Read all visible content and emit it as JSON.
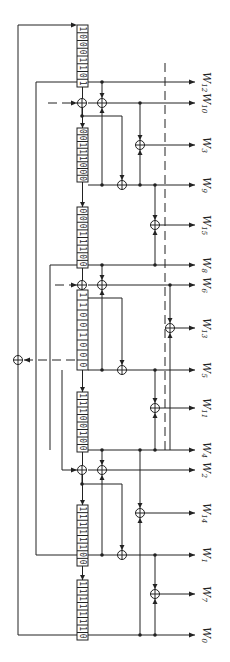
{
  "diagram": {
    "title": "",
    "orientation": "rotated-90",
    "registers": [
      {
        "id": "reg1",
        "bits": "10001101"
      },
      {
        "id": "reg2",
        "bits": "00111000"
      },
      {
        "id": "reg3",
        "bits": "00011100"
      },
      {
        "id": "reg4",
        "bits": "11001000"
      },
      {
        "id": "reg5",
        "bits": "11100100"
      },
      {
        "id": "reg6",
        "bits": "11111100"
      },
      {
        "id": "reg7",
        "bits": "11111110"
      }
    ],
    "outputs": [
      {
        "id": "W12",
        "base": "W",
        "sub": "12"
      },
      {
        "id": "W10",
        "base": "W",
        "sub": "10"
      },
      {
        "id": "W3",
        "base": "W",
        "sub": "3"
      },
      {
        "id": "W9",
        "base": "W",
        "sub": "9"
      },
      {
        "id": "W15",
        "base": "W",
        "sub": "15"
      },
      {
        "id": "W8",
        "base": "W",
        "sub": "8"
      },
      {
        "id": "W6",
        "base": "W",
        "sub": "6"
      },
      {
        "id": "W13",
        "base": "W",
        "sub": "13"
      },
      {
        "id": "W5",
        "base": "W",
        "sub": "5"
      },
      {
        "id": "W11",
        "base": "W",
        "sub": "11"
      },
      {
        "id": "W4",
        "base": "W",
        "sub": "4"
      },
      {
        "id": "W2",
        "base": "W",
        "sub": "2"
      },
      {
        "id": "W14",
        "base": "W",
        "sub": "14"
      },
      {
        "id": "W1",
        "base": "W",
        "sub": "1"
      },
      {
        "id": "W7",
        "base": "W",
        "sub": "7"
      },
      {
        "id": "W0",
        "base": "W",
        "sub": "0"
      }
    ],
    "colors": {
      "ink": "#222222",
      "background": "#ffffff"
    }
  }
}
